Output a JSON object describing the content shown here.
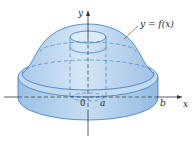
{
  "diagram": {
    "type": "solid-of-revolution",
    "labels": {
      "y_axis": "y",
      "x_axis": "x",
      "origin": "0",
      "inner_radius": "a",
      "outer_radius": "b",
      "curve": "y = f(x)"
    },
    "colors": {
      "solid_fill": "#bcd6ee",
      "solid_fill_dark": "#8fb8e0",
      "edge": "#4a86c5",
      "axis": "#333333",
      "text": "#2a2a2a"
    }
  }
}
